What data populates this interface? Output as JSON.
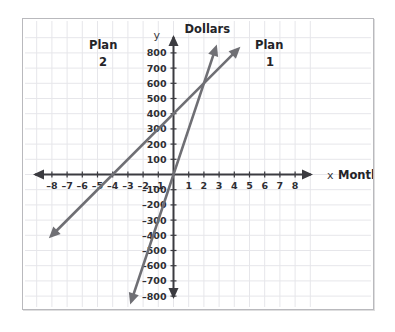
{
  "chart_data": {
    "type": "line",
    "title": "",
    "xlabel": "Months",
    "ylabel": "Dollars",
    "x_axis_symbol": "x",
    "y_axis_symbol": "y",
    "xlim": [
      -9,
      9
    ],
    "ylim": [
      -900,
      900
    ],
    "x_ticks": [
      -8,
      -7,
      -6,
      -5,
      -4,
      -3,
      -2,
      -1,
      1,
      2,
      3,
      4,
      5,
      6,
      7,
      8
    ],
    "x_tick_labels": [
      "–8",
      "–7",
      "–6",
      "–5",
      "–4",
      "–3",
      "–2",
      "–1",
      "1",
      "2",
      "3",
      "4",
      "5",
      "6",
      "7",
      "8"
    ],
    "y_ticks": [
      800,
      700,
      600,
      500,
      400,
      300,
      200,
      100,
      -100,
      -200,
      -300,
      -400,
      -500,
      -600,
      -700,
      -800
    ],
    "y_tick_labels": [
      "800",
      "700",
      "600",
      "500",
      "400",
      "300",
      "200",
      "100",
      "–100",
      "–200",
      "–300",
      "–400",
      "–500",
      "–600",
      "–700",
      "–800"
    ],
    "grid": true,
    "grid_x_step": 1,
    "grid_y_step": 100,
    "legend_position": "inline-at-line-ends",
    "line_color": "#6f6f74",
    "grid_color": "#e6e6ea",
    "axis_color": "#3b3b40",
    "series": [
      {
        "name": "Plan 1",
        "label": "Plan",
        "label_line2": "1",
        "slope": 100,
        "intercept": 400,
        "x_intercept": -4,
        "points": [
          [
            -8,
            -400
          ],
          [
            -4,
            0
          ],
          [
            0,
            400
          ],
          [
            2,
            600
          ],
          [
            4,
            800
          ]
        ],
        "arrow_start": [
          -8.2,
          -420
        ],
        "arrow_end": [
          4.4,
          840
        ]
      },
      {
        "name": "Plan 2",
        "label": "Plan",
        "label_line2": "2",
        "slope": 300,
        "intercept": 0,
        "x_intercept": 0,
        "points": [
          [
            -2.8,
            -840
          ],
          [
            0,
            0
          ],
          [
            2,
            600
          ],
          [
            2.8,
            840
          ]
        ],
        "arrow_start": [
          -2.85,
          -855
        ],
        "arrow_end": [
          2.85,
          855
        ]
      }
    ],
    "intersection": [
      2,
      600
    ]
  }
}
